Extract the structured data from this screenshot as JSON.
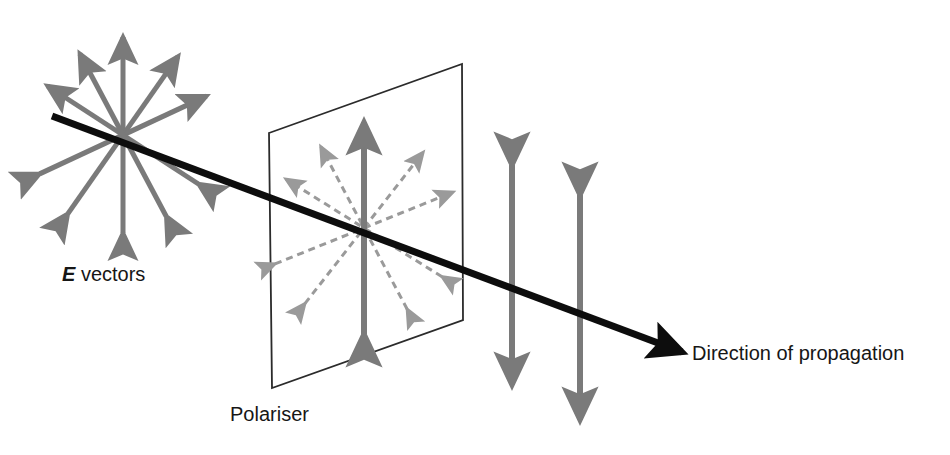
{
  "figure": {
    "background_color": "#ffffff",
    "width": 950,
    "height": 455
  },
  "colors": {
    "unpolarised_arrow": "#7a7a7a",
    "blocked_arrow": "#9a9a9a",
    "transmitted_arrow": "#7a7a7a",
    "propagation_line": "#0d0d0d",
    "polariser_outline": "#2b2b2b",
    "text": "#161616"
  },
  "labels": {
    "e_vectors_emph": "E",
    "e_vectors_rest": " vectors",
    "polariser": "Polariser",
    "direction_of_propagation": "Direction of propagation"
  },
  "propagation_ray": {
    "name": "direction-of-propagation-ray",
    "start": [
      52,
      116
    ],
    "end": [
      682,
      352
    ],
    "stroke_width": 7,
    "arrowhead": "solid-triangle"
  },
  "incident_star": {
    "name": "unpolarised-e-vectors",
    "center": [
      123,
      135
    ],
    "style": "solid",
    "arrow_count": 5,
    "stroke_width": 5,
    "arrows": [
      {
        "angle_deg": 90,
        "length": 98,
        "label": "vertical"
      },
      {
        "angle_deg": 55,
        "length": 96,
        "label": "diagonal-up-right-steep"
      },
      {
        "angle_deg": 25,
        "length": 92,
        "label": "diagonal-up-right-shallow"
      },
      {
        "angle_deg": 147,
        "length": 90,
        "label": "diagonal-up-left"
      },
      {
        "angle_deg": 118,
        "length": 92,
        "label": "diagonal-up-left-steep"
      }
    ]
  },
  "polariser": {
    "name": "polariser-plane",
    "corners": [
      [
        269,
        133
      ],
      [
        462,
        64
      ],
      [
        463,
        320
      ],
      [
        272,
        388
      ]
    ],
    "stroke_width": 1.8,
    "fill": "none"
  },
  "polariser_star": {
    "name": "e-vectors-at-polariser",
    "center": [
      364,
      228
    ],
    "transmitted": {
      "style": "solid",
      "angle_deg": 90,
      "length": 106,
      "stroke_width": 6,
      "label": "vertical-transmitted-component"
    },
    "blocked": {
      "style": "dashed",
      "dash_pattern": "7 5",
      "stroke_width": 3,
      "arrow_count": 4,
      "arrows": [
        {
          "angle_deg": 52,
          "length": 96,
          "label": "blocked-up-right-steep"
        },
        {
          "angle_deg": 22,
          "length": 96,
          "label": "blocked-up-right-shallow"
        },
        {
          "angle_deg": 148,
          "length": 92,
          "label": "blocked-up-left"
        },
        {
          "angle_deg": 118,
          "length": 92,
          "label": "blocked-up-left-steep"
        }
      ]
    }
  },
  "transmitted_arrows": [
    {
      "name": "polarised-arrow-1",
      "x": 512,
      "y_top": 165,
      "y_bottom": 385,
      "stroke_width": 6
    },
    {
      "name": "polarised-arrow-2",
      "x": 580,
      "y_top": 195,
      "y_bottom": 420,
      "stroke_width": 6
    }
  ],
  "label_positions": {
    "e_vectors": [
      62,
      281
    ],
    "polariser": [
      230,
      421
    ],
    "direction_of_propagation": [
      692,
      360
    ]
  }
}
